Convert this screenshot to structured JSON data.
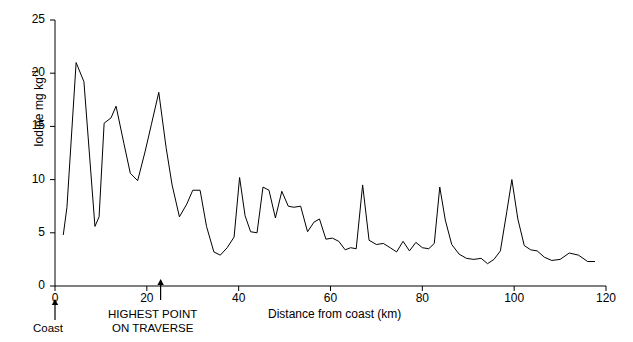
{
  "chart_data": {
    "type": "line",
    "title": "",
    "xlabel": "Distance from coast (km)",
    "ylabel": "Iodine mg kg-1",
    "ylabel_text": "Iodine mg kg",
    "ylabel_sup": "-1",
    "xlim": [
      0,
      120
    ],
    "ylim": [
      0,
      25
    ],
    "xticks": [
      0,
      20,
      40,
      60,
      80,
      100,
      120
    ],
    "yticks": [
      0,
      5,
      10,
      15,
      20,
      25
    ],
    "xtick_labels": [
      "0",
      "20",
      "40",
      "60",
      "80",
      "100",
      "120"
    ],
    "ytick_labels": [
      "0",
      "5",
      "10",
      "15",
      "20",
      "25"
    ],
    "grid": false,
    "legend": "none",
    "line_color": "#000000",
    "series": [
      {
        "name": "Iodine",
        "x": [
          1.8,
          2.6,
          4.6,
          6.3,
          8.7,
          9.6,
          10.7,
          12.2,
          13.3,
          15.0,
          16.4,
          18.0,
          19.6,
          21.0,
          22.6,
          24.2,
          25.5,
          27.1,
          28.7,
          30.0,
          31.6,
          33.0,
          34.6,
          36.0,
          37.5,
          39.0,
          40.2,
          41.4,
          42.6,
          44.0,
          45.3,
          46.6,
          48.0,
          49.4,
          50.8,
          52.0,
          53.5,
          55.0,
          56.4,
          57.6,
          59.0,
          60.4,
          61.8,
          63.2,
          64.4,
          65.6,
          67.0,
          68.4,
          70.0,
          71.5,
          73.0,
          74.4,
          75.8,
          77.2,
          78.6,
          80.0,
          81.4,
          82.6,
          83.8,
          85.0,
          86.4,
          88.0,
          89.6,
          91.2,
          92.8,
          94.2,
          95.6,
          97.0,
          98.4,
          99.5,
          100.8,
          102.2,
          103.6,
          105.0,
          106.6,
          108.2,
          110.0,
          112.0,
          114.0,
          116.0,
          117.6
        ],
        "y": [
          4.8,
          7.4,
          21.0,
          19.2,
          5.6,
          6.5,
          15.3,
          15.8,
          16.9,
          13.4,
          10.6,
          9.9,
          12.6,
          15.2,
          18.2,
          13.0,
          9.5,
          6.5,
          7.7,
          9.0,
          9.0,
          5.6,
          3.2,
          2.9,
          3.6,
          4.6,
          10.2,
          6.6,
          5.1,
          5.0,
          9.3,
          9.0,
          6.4,
          8.9,
          7.5,
          7.4,
          7.5,
          5.1,
          6.0,
          6.3,
          4.4,
          4.5,
          4.2,
          3.4,
          3.6,
          3.5,
          9.5,
          4.3,
          3.9,
          4.0,
          3.6,
          3.2,
          4.2,
          3.3,
          4.1,
          3.6,
          3.5,
          4.0,
          9.3,
          6.2,
          3.9,
          3.0,
          2.6,
          2.5,
          2.6,
          2.1,
          2.5,
          3.3,
          7.0,
          10.0,
          6.3,
          3.8,
          3.4,
          3.3,
          2.7,
          2.4,
          2.5,
          3.1,
          2.9,
          2.3,
          2.3
        ]
      }
    ],
    "annotations": [
      {
        "id": "coast",
        "text": "Coast",
        "x_value": 0,
        "arrow": "up"
      },
      {
        "id": "highest-point",
        "line1": "HIGHEST POINT",
        "line2": "ON TRAVERSE",
        "x_value": 23,
        "arrow": "up"
      }
    ]
  }
}
